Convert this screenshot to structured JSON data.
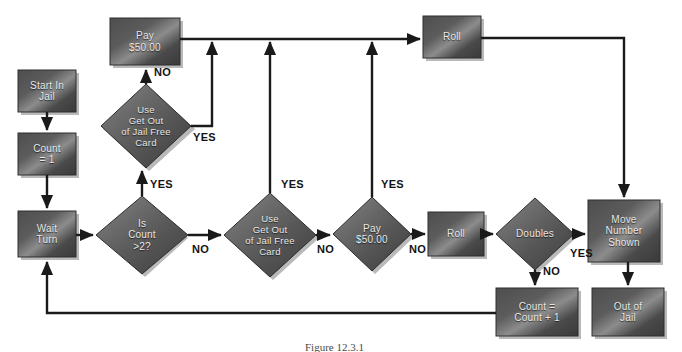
{
  "figure": {
    "caption": "Figure 12.3.1"
  },
  "colors": {
    "node_fill_dark": "#3a3a3a",
    "node_fill_light": "#8a8a8a",
    "node_text": "#e8e8e8",
    "edge_line": "#1a1a1a",
    "edge_label_text": "#141414",
    "background": "#ffffff",
    "shadow": "#b9b9b9"
  },
  "nodes": [
    {
      "id": "start-in-jail",
      "shape": "box",
      "label": "Start In\nJail",
      "x": 18,
      "y": 70,
      "w": 58,
      "h": 42
    },
    {
      "id": "count-equals-1",
      "shape": "box",
      "label": "Count\n= 1",
      "x": 18,
      "y": 133,
      "w": 58,
      "h": 42
    },
    {
      "id": "wait-turn",
      "shape": "box",
      "label": "Wait\nTurn",
      "x": 18,
      "y": 211,
      "w": 58,
      "h": 46
    },
    {
      "id": "pay-50-top",
      "shape": "box",
      "label": "Pay\n$50.00",
      "x": 110,
      "y": 18,
      "w": 70,
      "h": 47
    },
    {
      "id": "use-card-top",
      "shape": "diamond",
      "label": "Use\nGet Out\nof Jail Free\nCard",
      "x": 101,
      "y": 84,
      "w": 90,
      "h": 84
    },
    {
      "id": "is-count-gt2",
      "shape": "diamond",
      "label": "Is\nCount\n>2?",
      "x": 96,
      "y": 196,
      "w": 92,
      "h": 78
    },
    {
      "id": "use-card-mid",
      "shape": "diamond",
      "label": "Use\nGet Out\nof Jail Free\nCard",
      "x": 224,
      "y": 193,
      "w": 92,
      "h": 84
    },
    {
      "id": "pay-50-mid",
      "shape": "diamond",
      "label": "Pay\n$50.00",
      "x": 333,
      "y": 197,
      "w": 78,
      "h": 74
    },
    {
      "id": "roll-mid",
      "shape": "box",
      "label": "Roll",
      "x": 428,
      "y": 212,
      "w": 56,
      "h": 44
    },
    {
      "id": "doubles",
      "shape": "diamond",
      "label": "Doubles",
      "x": 496,
      "y": 198,
      "w": 78,
      "h": 72
    },
    {
      "id": "roll-top",
      "shape": "box",
      "label": "Roll",
      "x": 423,
      "y": 16,
      "w": 58,
      "h": 42
    },
    {
      "id": "move-number-shown",
      "shape": "box",
      "label": "Move\nNumber\nShown",
      "x": 588,
      "y": 200,
      "w": 72,
      "h": 62
    },
    {
      "id": "count-plus-1",
      "shape": "box",
      "label": "Count =\nCount + 1",
      "x": 496,
      "y": 288,
      "w": 82,
      "h": 48
    },
    {
      "id": "out-of-jail",
      "shape": "box",
      "label": "Out of\nJail",
      "x": 592,
      "y": 288,
      "w": 72,
      "h": 48
    }
  ],
  "edge_labels": [
    {
      "id": "no-use-card-top",
      "text": "NO",
      "x": 154,
      "y": 66
    },
    {
      "id": "yes-use-card-top",
      "text": "YES",
      "x": 193,
      "y": 131
    },
    {
      "id": "yes-is-count",
      "text": "YES",
      "x": 150,
      "y": 178
    },
    {
      "id": "no-is-count",
      "text": "NO",
      "x": 192,
      "y": 243
    },
    {
      "id": "yes-use-card-mid",
      "text": "YES",
      "x": 281,
      "y": 178
    },
    {
      "id": "no-use-card-mid",
      "text": "NO",
      "x": 317,
      "y": 243
    },
    {
      "id": "yes-pay-mid",
      "text": "YES",
      "x": 381,
      "y": 178
    },
    {
      "id": "no-pay-mid",
      "text": "NO",
      "x": 409,
      "y": 243
    },
    {
      "id": "yes-doubles",
      "text": "YES",
      "x": 570,
      "y": 247
    },
    {
      "id": "no-doubles",
      "text": "NO",
      "x": 543,
      "y": 265
    }
  ],
  "edges": [
    {
      "id": "start-to-count",
      "from": "start-in-jail",
      "to": "count-equals-1"
    },
    {
      "id": "count-to-wait",
      "from": "count-equals-1",
      "to": "wait-turn"
    },
    {
      "id": "wait-to-is-count",
      "from": "wait-turn",
      "to": "is-count-gt2"
    },
    {
      "id": "is-count-yes-to-use-top",
      "from": "is-count-gt2",
      "to": "use-card-top",
      "branch": "YES"
    },
    {
      "id": "is-count-no-to-use-mid",
      "from": "is-count-gt2",
      "to": "use-card-mid",
      "branch": "NO"
    },
    {
      "id": "use-top-no-to-pay-top",
      "from": "use-card-top",
      "to": "pay-50-top",
      "branch": "NO"
    },
    {
      "id": "use-top-yes-to-top-rail",
      "from": "use-card-top",
      "to": "roll-top",
      "branch": "YES"
    },
    {
      "id": "pay-top-to-roll-top",
      "from": "pay-50-top",
      "to": "roll-top"
    },
    {
      "id": "use-mid-yes-to-top-rail",
      "from": "use-card-mid",
      "to": "roll-top",
      "branch": "YES"
    },
    {
      "id": "use-mid-no-to-pay-mid",
      "from": "use-card-mid",
      "to": "pay-50-mid",
      "branch": "NO"
    },
    {
      "id": "pay-mid-yes-to-top-rail",
      "from": "pay-50-mid",
      "to": "roll-top",
      "branch": "YES"
    },
    {
      "id": "pay-mid-no-to-roll-mid",
      "from": "pay-50-mid",
      "to": "roll-mid",
      "branch": "NO"
    },
    {
      "id": "roll-mid-to-doubles",
      "from": "roll-mid",
      "to": "doubles"
    },
    {
      "id": "doubles-yes-to-move",
      "from": "doubles",
      "to": "move-number-shown",
      "branch": "YES"
    },
    {
      "id": "doubles-no-to-count-plus",
      "from": "doubles",
      "to": "count-plus-1",
      "branch": "NO"
    },
    {
      "id": "roll-top-to-move",
      "from": "roll-top",
      "to": "move-number-shown"
    },
    {
      "id": "move-to-out-of-jail",
      "from": "move-number-shown",
      "to": "out-of-jail"
    },
    {
      "id": "count-plus-to-wait",
      "from": "count-plus-1",
      "to": "wait-turn"
    }
  ]
}
